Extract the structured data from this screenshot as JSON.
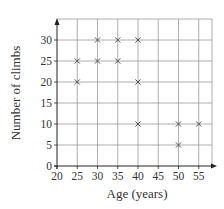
{
  "chart_data": {
    "type": "scatter",
    "title": "",
    "xlabel": "Age (years)",
    "ylabel": "Number of climbs",
    "xlim": [
      20,
      59
    ],
    "ylim": [
      0,
      35
    ],
    "grid": true,
    "x_ticks": [
      20,
      25,
      30,
      35,
      40,
      45,
      50,
      55
    ],
    "y_ticks": [
      0,
      5,
      10,
      15,
      20,
      25,
      30
    ],
    "marker": "x",
    "points": [
      {
        "x": 25,
        "y": 25
      },
      {
        "x": 25,
        "y": 20
      },
      {
        "x": 30,
        "y": 30
      },
      {
        "x": 30,
        "y": 25
      },
      {
        "x": 35,
        "y": 30
      },
      {
        "x": 35,
        "y": 25
      },
      {
        "x": 40,
        "y": 30
      },
      {
        "x": 40,
        "y": 20
      },
      {
        "x": 40,
        "y": 10
      },
      {
        "x": 50,
        "y": 10
      },
      {
        "x": 50,
        "y": 5
      },
      {
        "x": 55,
        "y": 10
      }
    ]
  },
  "colors": {
    "axis": "#222222",
    "grid": "#9a9a9a",
    "marker": "#555555",
    "text": "#333333"
  }
}
